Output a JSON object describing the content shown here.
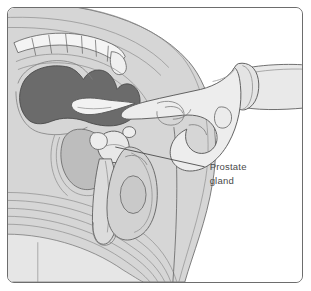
{
  "figure": {
    "kind": "medical-illustration",
    "view": "sagittal cross-section of male pelvis",
    "frame": {
      "border_color": "#6d6d6d",
      "background_color": "#ffffff",
      "corner_radius": "7"
    }
  },
  "labels": {
    "prostate": {
      "line1": "Prostate",
      "line2": "gland",
      "text_color": "#4a4a4a",
      "leader_from_x": "198",
      "leader_from_y": "160",
      "leader_to_x": "108",
      "leader_to_y": "140"
    }
  },
  "palette": {
    "body_fill": "#d6d6d6",
    "body_fill_light": "#e2e2e2",
    "body_fill_lighter": "#ebebeb",
    "rectum_dark": "#6b6b6b",
    "bladder_mid": "#bdbdbd",
    "glove_fill": "#ededed",
    "outline": "#555555",
    "outline_soft": "#8a8a8a",
    "bone_fill": "#f2f2f2",
    "paper_white": "#ffffff"
  },
  "anatomy_parts": [
    {
      "name": "sacrum-vertebrae",
      "tone": "#f2f2f2"
    },
    {
      "name": "rectum",
      "tone": "#6b6b6b"
    },
    {
      "name": "bladder",
      "tone": "#bdbdbd"
    },
    {
      "name": "prostate-gland",
      "tone": "#e6e6e6"
    },
    {
      "name": "penis",
      "tone": "#dcdcdc"
    },
    {
      "name": "scrotum-testis",
      "tone": "#d2d2d2"
    },
    {
      "name": "buttock-muscle-layers",
      "tone": "#cfcfcf"
    },
    {
      "name": "pubic-bone",
      "tone": "#e8e8e8"
    },
    {
      "name": "examining-hand",
      "tone": "#ededed"
    },
    {
      "name": "glove-cuff",
      "tone": "#e4e4e4"
    },
    {
      "name": "forearm",
      "tone": "#e9e9e9"
    }
  ]
}
